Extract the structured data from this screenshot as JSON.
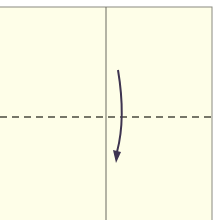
{
  "diagram": {
    "type": "origami-fold-step",
    "paper": {
      "color": "#fefee8",
      "edge_color": "#8a8a80",
      "left": -2,
      "top": 7,
      "right": 212,
      "bottom": 222
    },
    "crease": {
      "style": "solid",
      "color": "#6a6a60",
      "x": 106
    },
    "fold_line": {
      "style": "dashed",
      "kind": "valley-fold",
      "color": "#4a4a3e",
      "y": 117
    },
    "arrow": {
      "direction": "down",
      "meaning": "fold top half down",
      "color": "#3e3450",
      "start": [
        118,
        70
      ],
      "end": [
        116,
        162
      ]
    }
  }
}
